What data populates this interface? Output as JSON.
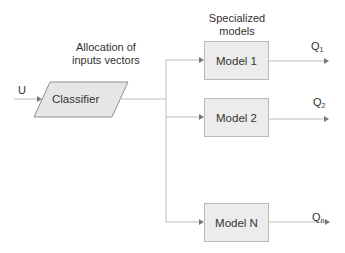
{
  "diagram": {
    "input_label": "U",
    "classifier_label": "Classifier",
    "allocation_label_line1": "Allocation of",
    "allocation_label_line2": "inputs vectors",
    "specialized_label_line1": "Specialized",
    "specialized_label_line2": "models",
    "models": [
      {
        "label": "Model 1",
        "output": "Q",
        "output_sub": "1"
      },
      {
        "label": "Model 2",
        "output": "Q",
        "output_sub": "2"
      },
      {
        "label": "Model N",
        "output": "Q",
        "output_sub": "n"
      }
    ],
    "colors": {
      "line": "#bdbdbd",
      "arrow": "#7a7a7a",
      "box_fill": "#ececec",
      "box_border": "#b9b9b9",
      "text": "#333333"
    }
  }
}
